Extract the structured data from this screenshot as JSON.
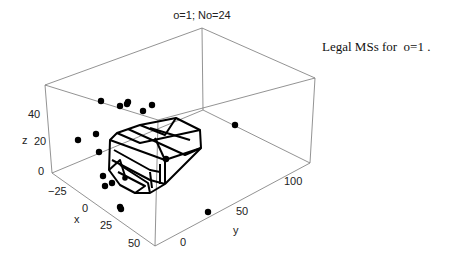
{
  "chart_data": {
    "type": "scatter3d",
    "title": "o=1; No=24",
    "annotation": "Legal MSs for  o=1 .",
    "xlabel": "x",
    "ylabel": "y",
    "zlabel": "z",
    "x_ticks": [
      "-25",
      "0",
      "25",
      "50"
    ],
    "y_ticks": [
      "0",
      "50",
      "100"
    ],
    "z_ticks": [
      "0",
      "20",
      "40"
    ],
    "xlim": [
      -40,
      60
    ],
    "ylim": [
      -15,
      130
    ],
    "zlim": [
      0,
      50
    ],
    "grid": false,
    "point_count": 24,
    "points_screen": [
      [
        101,
        101
      ],
      [
        120,
        106
      ],
      [
        127,
        104
      ],
      [
        128,
        102
      ],
      [
        143,
        111
      ],
      [
        152,
        105
      ],
      [
        78,
        140
      ],
      [
        96,
        134
      ],
      [
        99,
        152
      ],
      [
        103,
        176
      ],
      [
        105,
        186
      ],
      [
        112,
        183
      ],
      [
        120,
        207
      ],
      [
        121,
        209
      ],
      [
        208,
        212
      ],
      [
        235,
        125
      ],
      [
        166,
        159
      ],
      [
        125,
        178
      ],
      [
        118,
        173
      ],
      [
        130,
        180
      ],
      [
        140,
        184
      ],
      [
        150,
        176
      ],
      [
        160,
        168
      ],
      [
        135,
        170
      ]
    ],
    "polyhedron_note": "wireframe convex region of legal MSs"
  },
  "title": "o=1; No=24",
  "caption": "Legal MSs for  o=1 ."
}
